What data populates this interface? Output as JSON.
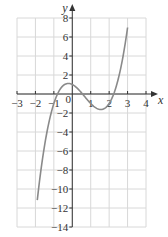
{
  "chart_data": {
    "type": "line",
    "title": "",
    "xlabel": "x",
    "ylabel": "y",
    "xlim": [
      -3,
      4
    ],
    "ylim": [
      -14,
      8
    ],
    "grid": true,
    "x_ticks": [
      -3,
      -2,
      -1,
      0,
      1,
      2,
      3,
      4
    ],
    "x_tick_labels": [
      "−3",
      "−2",
      "−1",
      "0",
      "1",
      "2",
      "3",
      "4"
    ],
    "y_ticks": [
      8,
      6,
      4,
      2,
      -2,
      -4,
      -6,
      -8,
      -10,
      -12,
      -14
    ],
    "y_tick_labels": [
      "8",
      "6",
      "4",
      "2",
      "−2",
      "−4",
      "−6",
      "−8",
      "−10",
      "−12",
      "−14"
    ],
    "series": [
      {
        "name": "cubic curve",
        "color": "#8a8a8a",
        "x": [
          -1.9,
          -1.5,
          -1.0,
          -0.8,
          -0.5,
          -0.2,
          0,
          0.5,
          1.0,
          1.5,
          1.8,
          2.0,
          2.2,
          2.5,
          2.8,
          3.0
        ],
        "y": [
          -12.9,
          -5.6,
          -1.0,
          0.0,
          0.88,
          1.11,
          1.0,
          0.13,
          -1.0,
          -1.62,
          -1.5,
          -1.0,
          -0.25,
          1.63,
          4.4,
          7.0
        ]
      }
    ],
    "legend": []
  },
  "labels": {
    "x_axis": "x",
    "y_axis": "y",
    "origin": "0"
  },
  "colors": {
    "grid": "#d8d8d8",
    "axis": "#333333",
    "curve": "#8a8a8a"
  }
}
